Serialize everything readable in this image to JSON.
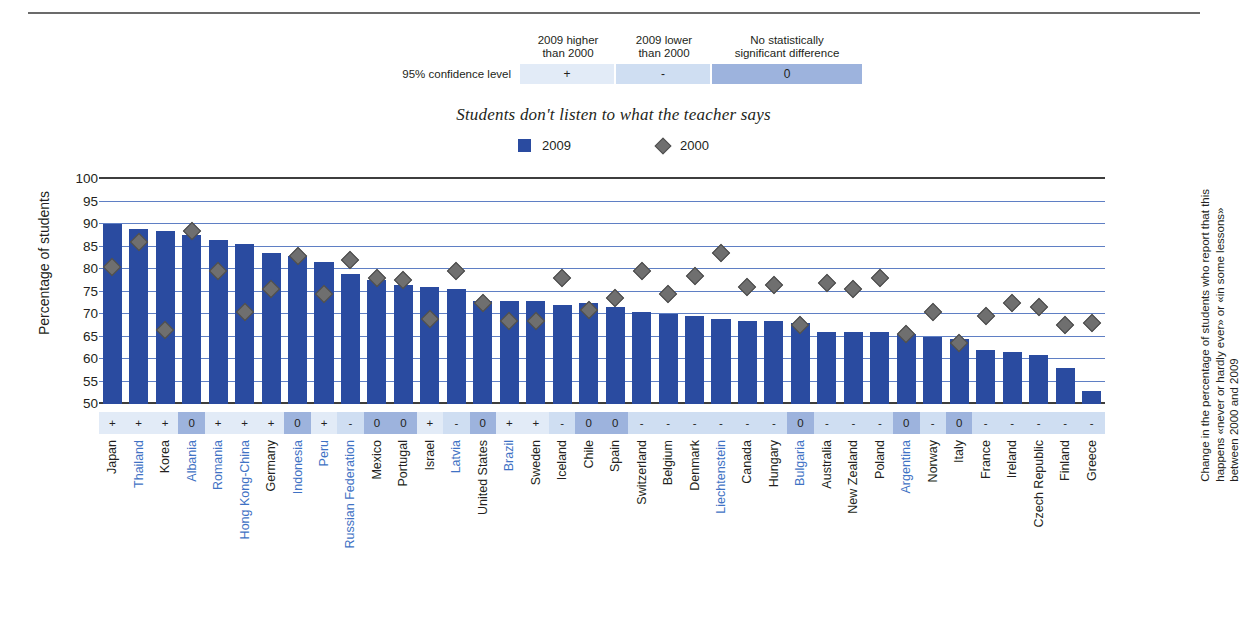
{
  "significance_legend": {
    "row_label": "95% confidence level",
    "headers": [
      "2009 higher\nthan 2000",
      "2009 lower\nthan 2000",
      "No statistically\nsignificant difference"
    ],
    "headers_lines": [
      [
        "2009 higher",
        "than 2000"
      ],
      [
        "2009 lower",
        "than 2000"
      ],
      [
        "No statistically",
        "significant difference"
      ]
    ],
    "symbols": [
      "+",
      "-",
      "0"
    ],
    "colors": {
      "higher": "#e2ebf7",
      "lower": "#cfdef2",
      "nodiff": "#9db3dd"
    }
  },
  "legend": {
    "series": [
      {
        "label": "2009",
        "marker": "square",
        "color": "#2a4ba0"
      },
      {
        "label": "2000",
        "marker": "diamond",
        "color": "#6f6f6f"
      }
    ]
  },
  "axis": {
    "ylabel": "Percentage of students",
    "yticks": [
      100,
      95,
      90,
      85,
      80,
      75,
      70,
      65,
      60,
      55,
      50
    ]
  },
  "right_note": "Change in the percentage of students who report that this happens «never or hardly ever» or «in some lessons» between 2000 and 2009",
  "chart_data": {
    "type": "bar",
    "title": "Students don't listen to what the teacher says",
    "xlabel": "",
    "ylabel": "Percentage of students",
    "ylim": [
      50,
      100
    ],
    "ytick_step": 5,
    "grid": true,
    "legend_position": "top-center",
    "categories": [
      "Japan",
      "Thailand",
      "Korea",
      "Albania",
      "Romania",
      "Hong Kong-China",
      "Germany",
      "Indonesia",
      "Peru",
      "Russian Federation",
      "Mexico",
      "Portugal",
      "Israel",
      "Latvia",
      "United States",
      "Brazil",
      "Sweden",
      "Iceland",
      "Chile",
      "Spain",
      "Switzerland",
      "Belgium",
      "Denmark",
      "Liechtenstein",
      "Canada",
      "Hungary",
      "Bulgaria",
      "Australia",
      "New Zealand",
      "Poland",
      "Argentina",
      "Norway",
      "Italy",
      "France",
      "Ireland",
      "Czech Republic",
      "Finland",
      "Greece"
    ],
    "highlighted_categories": [
      "Thailand",
      "Albania",
      "Romania",
      "Hong Kong-China",
      "Indonesia",
      "Peru",
      "Russian Federation",
      "Latvia",
      "Brazil",
      "Liechtenstein",
      "Bulgaria",
      "Argentina"
    ],
    "series": [
      {
        "name": "2009",
        "marker": "bar",
        "color": "#2a4ba0",
        "values": [
          90.0,
          89.0,
          88.5,
          87.5,
          86.5,
          85.5,
          83.5,
          83.0,
          81.5,
          79.0,
          77.5,
          76.5,
          76.0,
          75.5,
          73.0,
          73.0,
          73.0,
          72.0,
          72.5,
          71.5,
          70.5,
          70.0,
          69.5,
          69.0,
          68.5,
          68.5,
          68.0,
          66.0,
          66.0,
          66.0,
          65.5,
          65.0,
          64.5,
          62.0,
          61.5,
          61.0,
          58.0,
          53.0
        ]
      },
      {
        "name": "2000",
        "marker": "diamond",
        "color": "#6f6f6f",
        "values": [
          80.5,
          86.0,
          66.5,
          88.5,
          79.5,
          70.5,
          75.5,
          83.0,
          74.5,
          82.0,
          78.0,
          77.5,
          69.0,
          79.5,
          72.5,
          68.5,
          68.5,
          78.0,
          71.0,
          73.5,
          79.5,
          74.5,
          78.5,
          83.5,
          76.0,
          76.5,
          67.5,
          77.0,
          75.5,
          78.0,
          65.5,
          70.5,
          63.5,
          69.5,
          72.5,
          71.5,
          67.5,
          68.0
        ]
      }
    ],
    "significance": [
      "+",
      "+",
      "+",
      "0",
      "+",
      "+",
      "+",
      "0",
      "+",
      "-",
      "0",
      "0",
      "+",
      "-",
      "0",
      "+",
      "+",
      "-",
      "0",
      "0",
      "-",
      "-",
      "-",
      "-",
      "-",
      "-",
      "0",
      "-",
      "-",
      "-",
      "0",
      "-",
      "0",
      "-",
      "-",
      "-",
      "-",
      "-"
    ]
  }
}
